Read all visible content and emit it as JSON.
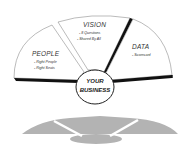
{
  "diagram": {
    "segments": [
      {
        "id": "people",
        "title": "PEOPLE",
        "items": [
          "- Right People",
          "- Right Seats"
        ]
      },
      {
        "id": "vision",
        "title": "VISION",
        "items": [
          "- 8 Questions",
          "- Shared By All"
        ]
      },
      {
        "id": "data",
        "title": "DATA",
        "items": [
          "- Scorecard"
        ]
      }
    ],
    "center": {
      "line1": "YOUR",
      "line2": "BUSINESS"
    },
    "colors": {
      "outline": "#222222",
      "fill": "#ffffff",
      "shadow": "#b3b3b3",
      "text": "#333333"
    }
  }
}
